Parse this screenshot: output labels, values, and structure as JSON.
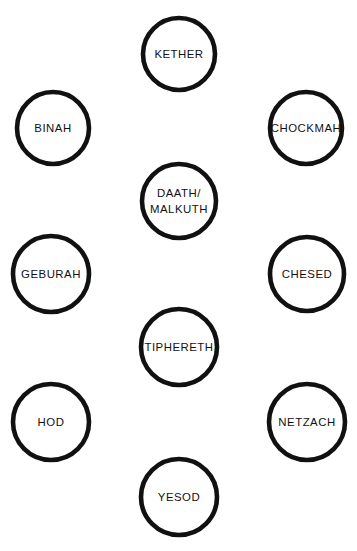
{
  "diagram": {
    "type": "kabbalistic-tree-of-life",
    "style": {
      "background_color": "#ffffff",
      "stroke_color": "#111111",
      "fill_color": "#ffffff",
      "connector_style": "double-line-band"
    },
    "nodes": [
      {
        "id": "kether",
        "label": "KETHER",
        "cx": 179,
        "cy": 54,
        "r": 36
      },
      {
        "id": "binah",
        "label": "BINAH",
        "cx": 53,
        "cy": 128,
        "r": 36
      },
      {
        "id": "chockmah",
        "label": "CHOCKMAH",
        "cx": 306,
        "cy": 128,
        "r": 36
      },
      {
        "id": "daath",
        "label": "DAATH/",
        "label2": "MALKUTH",
        "cx": 179,
        "cy": 201,
        "r": 37
      },
      {
        "id": "geburah",
        "label": "GEBURAH",
        "cx": 51,
        "cy": 274,
        "r": 38
      },
      {
        "id": "chesed",
        "label": "CHESED",
        "cx": 307,
        "cy": 274,
        "r": 37
      },
      {
        "id": "tiphereth",
        "label": "TIPHERETH",
        "cx": 179,
        "cy": 347,
        "r": 38
      },
      {
        "id": "hod",
        "label": "HOD",
        "cx": 51,
        "cy": 422,
        "r": 38
      },
      {
        "id": "netzach",
        "label": "NETZACH",
        "cx": 307,
        "cy": 422,
        "r": 38
      },
      {
        "id": "yesod",
        "label": "YESOD",
        "cx": 179,
        "cy": 497,
        "r": 38
      }
    ],
    "edges": [
      {
        "from": "binah",
        "to": "kether"
      },
      {
        "from": "kether",
        "to": "chockmah"
      },
      {
        "from": "binah",
        "to": "chockmah"
      },
      {
        "from": "kether",
        "to": "daath"
      },
      {
        "from": "binah",
        "to": "daath"
      },
      {
        "from": "chockmah",
        "to": "daath"
      },
      {
        "from": "binah",
        "to": "geburah"
      },
      {
        "from": "chockmah",
        "to": "chesed"
      },
      {
        "from": "binah",
        "to": "tiphereth"
      },
      {
        "from": "chockmah",
        "to": "tiphereth"
      },
      {
        "from": "geburah",
        "to": "daath"
      },
      {
        "from": "chesed",
        "to": "daath"
      },
      {
        "from": "geburah",
        "to": "chesed"
      },
      {
        "from": "daath",
        "to": "tiphereth"
      },
      {
        "from": "geburah",
        "to": "tiphereth"
      },
      {
        "from": "chesed",
        "to": "tiphereth"
      },
      {
        "from": "geburah",
        "to": "hod"
      },
      {
        "from": "chesed",
        "to": "netzach"
      },
      {
        "from": "geburah",
        "to": "yesod"
      },
      {
        "from": "chesed",
        "to": "yesod"
      },
      {
        "from": "hod",
        "to": "tiphereth"
      },
      {
        "from": "netzach",
        "to": "tiphereth"
      },
      {
        "from": "hod",
        "to": "netzach"
      },
      {
        "from": "tiphereth",
        "to": "yesod"
      },
      {
        "from": "hod",
        "to": "yesod"
      },
      {
        "from": "netzach",
        "to": "yesod"
      }
    ],
    "band_width": 14
  }
}
